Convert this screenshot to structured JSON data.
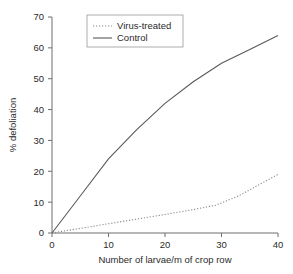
{
  "chart_data": {
    "type": "line",
    "title": "",
    "xlabel": "Number of larvae/m of crop row",
    "ylabel": "% defoliation",
    "xlim": [
      0,
      40
    ],
    "ylim": [
      0,
      70
    ],
    "xticks": [
      "0",
      "10",
      "20",
      "30",
      "40"
    ],
    "yticks": [
      "0",
      "10",
      "20",
      "30",
      "40",
      "50",
      "60",
      "70"
    ],
    "xtick_values": [
      0,
      10,
      20,
      30,
      40
    ],
    "ytick_values": [
      0,
      10,
      20,
      30,
      40,
      50,
      60,
      70
    ],
    "grid": false,
    "legend_position": "top-center",
    "series": [
      {
        "name": "Virus-treated",
        "style": "dotted",
        "color": "#8a8a8a",
        "x": [
          0,
          5,
          10,
          15,
          20,
          25,
          29,
          33,
          36,
          40
        ],
        "values": [
          0,
          1.5,
          3.0,
          4.5,
          6.0,
          7.6,
          9.0,
          12.0,
          15.0,
          19.0
        ]
      },
      {
        "name": "Control",
        "style": "solid",
        "color": "#5a5a5a",
        "x": [
          0,
          5,
          10,
          15,
          20,
          25,
          30,
          35,
          40
        ],
        "values": [
          0,
          12.0,
          24.0,
          33.5,
          42.0,
          49.0,
          55.0,
          59.5,
          64.0
        ]
      }
    ]
  },
  "legend": {
    "items": [
      {
        "label": "Virus-treated",
        "style": "dotted"
      },
      {
        "label": "Control",
        "style": "solid"
      }
    ]
  },
  "axes": {
    "x_title": "Number of larvae/m of crop row",
    "y_title": "% defoliation",
    "x_labels": [
      "0",
      "10",
      "20",
      "30",
      "40"
    ],
    "y_labels": [
      "0",
      "10",
      "20",
      "30",
      "40",
      "50",
      "60",
      "70"
    ]
  },
  "colors": {
    "axis": "#6e6e6e",
    "control": "#5a5a5a",
    "virus": "#8a8a8a",
    "text": "#2b2b2b",
    "background": "#ffffff"
  }
}
